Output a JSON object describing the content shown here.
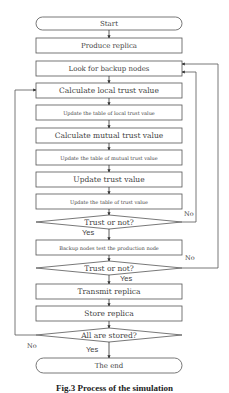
{
  "flowchart": {
    "nodes": [
      {
        "id": "start",
        "type": "terminal",
        "label": "Start",
        "top": 17,
        "h": 13,
        "fs": 7
      },
      {
        "id": "produce",
        "type": "process",
        "label": "Produce replica",
        "top": 38,
        "h": 15,
        "fs": 7
      },
      {
        "id": "look",
        "type": "process",
        "label": "Look for backup nodes",
        "top": 61,
        "h": 15,
        "fs": 7
      },
      {
        "id": "calc-local",
        "type": "process",
        "label": "Calculate local trust value",
        "top": 83,
        "h": 15,
        "fs": 7.5
      },
      {
        "id": "upd-local",
        "type": "process",
        "label": "Update the table of local trust value",
        "top": 105,
        "h": 15,
        "fs": 5
      },
      {
        "id": "calc-mutual",
        "type": "process",
        "label": "Calculate mutual trust value",
        "top": 128,
        "h": 15,
        "fs": 7.5
      },
      {
        "id": "upd-mutual",
        "type": "process",
        "label": "Update the table of mutual trust value",
        "top": 150,
        "h": 15,
        "fs": 5
      },
      {
        "id": "upd-trust",
        "type": "process",
        "label": "Update trust value",
        "top": 172,
        "h": 15,
        "fs": 7.5
      },
      {
        "id": "upd-table",
        "type": "process",
        "label": "Update the table of trust value",
        "top": 194,
        "h": 15,
        "fs": 5
      },
      {
        "id": "dec1",
        "type": "decision",
        "label": "Trust or not?",
        "cy": 222,
        "fs": 7.5
      },
      {
        "id": "backup-test",
        "type": "process",
        "label": "Backup nodes test the production node",
        "top": 240,
        "h": 15,
        "fs": 5
      },
      {
        "id": "dec2",
        "type": "decision",
        "label": "Trust or not?",
        "cy": 268,
        "fs": 7.5
      },
      {
        "id": "transmit",
        "type": "process",
        "label": "Transmit replica",
        "top": 284,
        "h": 15,
        "fs": 7.5
      },
      {
        "id": "store",
        "type": "process",
        "label": "Store replica",
        "top": 306,
        "h": 15,
        "fs": 7.5
      },
      {
        "id": "dec3",
        "type": "decision",
        "label": "All are stored?",
        "cy": 335,
        "fs": 7.5
      },
      {
        "id": "end",
        "type": "terminal",
        "label": "The end",
        "top": 358,
        "h": 15,
        "fs": 7
      }
    ],
    "edge_labels": {
      "dec1_yes": "Yes",
      "dec1_no": "No",
      "dec2_yes": "Yes",
      "dec2_no": "No",
      "dec3_yes": "Yes",
      "dec3_no": "No"
    }
  },
  "caption": "Fig.3 Process of the simulation"
}
